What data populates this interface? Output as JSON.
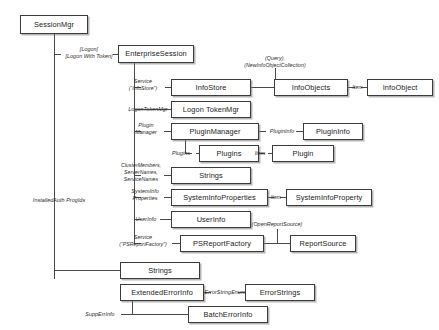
{
  "diagram": {
    "type": "object-model-diagram",
    "nodes": [
      {
        "id": "session-mgr",
        "label": "SessionMgr",
        "x": 20,
        "y": 15,
        "w": 68,
        "h": 19
      },
      {
        "id": "enterprise-session",
        "label": "EnterpriseSession",
        "x": 118,
        "y": 45,
        "w": 76,
        "h": 18
      },
      {
        "id": "info-store",
        "label": "InfoStore",
        "x": 171,
        "y": 79,
        "w": 80,
        "h": 17
      },
      {
        "id": "info-objects",
        "label": "InfoObjects",
        "x": 274,
        "y": 79,
        "w": 74,
        "h": 17
      },
      {
        "id": "info-object",
        "label": "InfoObject",
        "x": 367,
        "y": 79,
        "w": 66,
        "h": 17
      },
      {
        "id": "logon-token-mgr",
        "label": "Logon TokenMgr",
        "x": 171,
        "y": 101,
        "w": 80,
        "h": 17
      },
      {
        "id": "plugin-manager",
        "label": "PluginManager",
        "x": 171,
        "y": 123,
        "w": 88,
        "h": 17
      },
      {
        "id": "plugin-info",
        "label": "PluginInfo",
        "x": 303,
        "y": 123,
        "w": 60,
        "h": 17
      },
      {
        "id": "plugins",
        "label": "Plugins",
        "x": 199,
        "y": 145,
        "w": 60,
        "h": 17
      },
      {
        "id": "plugin",
        "label": "Plugin",
        "x": 272,
        "y": 145,
        "w": 62,
        "h": 17
      },
      {
        "id": "strings-cluster",
        "label": "Strings",
        "x": 171,
        "y": 167,
        "w": 80,
        "h": 17
      },
      {
        "id": "system-info-properties",
        "label": "SystemInfoProperties",
        "x": 171,
        "y": 189,
        "w": 97,
        "h": 17
      },
      {
        "id": "system-info-property",
        "label": "SystemInfoProperty",
        "x": 286,
        "y": 189,
        "w": 86,
        "h": 17
      },
      {
        "id": "user-info",
        "label": "UserInfo",
        "x": 171,
        "y": 211,
        "w": 80,
        "h": 17
      },
      {
        "id": "ps-report-factory",
        "label": "PSReportFactory",
        "x": 180,
        "y": 235,
        "w": 84,
        "h": 17
      },
      {
        "id": "report-source",
        "label": "ReportSource",
        "x": 290,
        "y": 235,
        "w": 66,
        "h": 17
      },
      {
        "id": "strings-auth",
        "label": "Strings",
        "x": 120,
        "y": 262,
        "w": 80,
        "h": 17
      },
      {
        "id": "extended-error-info",
        "label": "ExtendedErrorInfo",
        "x": 120,
        "y": 284,
        "w": 84,
        "h": 17
      },
      {
        "id": "error-strings",
        "label": "ErrorStrings",
        "x": 245,
        "y": 284,
        "w": 70,
        "h": 17
      },
      {
        "id": "batch-error-info",
        "label": "BatchErrorInfo",
        "x": 188,
        "y": 306,
        "w": 80,
        "h": 17
      }
    ],
    "edge_labels": [
      {
        "id": "lbl-logon",
        "line1": "[Logon]",
        "line2": "[Logon With Token]",
        "x": 61,
        "y": 46,
        "w": 56
      },
      {
        "id": "lbl-service-infostore",
        "line1": "Service",
        "line2": "(“InfoStore”)",
        "x": 119,
        "y": 78,
        "w": 50
      },
      {
        "id": "lbl-query",
        "line1": "(Query),",
        "line2": "(NewInfoObjectCollection)",
        "x": 244,
        "y": 56,
        "w": 62
      },
      {
        "id": "lbl-item-infoobject",
        "line1": "Item",
        "line2": "",
        "x": 348,
        "y": 83,
        "w": 19
      },
      {
        "id": "lbl-logontokenmgr",
        "line1": "LogonTokenMgr",
        "line2": "",
        "x": 125,
        "y": 106,
        "w": 46
      },
      {
        "id": "lbl-plugin-manager",
        "line1": "Plugin",
        "line2": "Manager",
        "x": 125,
        "y": 122,
        "w": 44
      },
      {
        "id": "lbl-plugininfo",
        "line1": "PluginInfo",
        "line2": "",
        "x": 263,
        "y": 128,
        "w": 38
      },
      {
        "id": "lbl-plugins",
        "line1": "Plugins",
        "line2": "",
        "x": 167,
        "y": 150,
        "w": 30
      },
      {
        "id": "lbl-item-plugin",
        "line1": "Item",
        "line2": "",
        "x": 250,
        "y": 150,
        "w": 20
      },
      {
        "id": "lbl-clustermembers",
        "line1": "ClusterMembers,",
        "line2": "ServerNames,",
        "line3": "ServiceNames",
        "x": 116,
        "y": 163,
        "w": 54
      },
      {
        "id": "lbl-systeminfoprops",
        "line1": "SystemInfo",
        "line2": "Properties",
        "x": 122,
        "y": 188,
        "w": 48
      },
      {
        "id": "lbl-item-sysinfoprop",
        "line1": "Item",
        "line2": "",
        "x": 266,
        "y": 193,
        "w": 20
      },
      {
        "id": "lbl-userinfo",
        "line1": "UserInfo",
        "line2": "",
        "x": 127,
        "y": 215,
        "w": 38
      },
      {
        "id": "lbl-service-psreport",
        "line1": "Service",
        "line2": "(“PSReportFactory”)",
        "x": 110,
        "y": 234,
        "w": 68
      },
      {
        "id": "lbl-openreportsource",
        "line1": "(OpenReportSource)",
        "line2": "",
        "x": 244,
        "y": 222,
        "w": 64
      },
      {
        "id": "lbl-installedauth",
        "line1": "InstalledAuth ProgIds",
        "line2": "",
        "x": 22,
        "y": 197,
        "w": 74
      },
      {
        "id": "lbl-errorstringenum",
        "line1": "ErrorStringEnum",
        "line2": "",
        "x": 204,
        "y": 289,
        "w": 42
      },
      {
        "id": "lbl-supperrinfo",
        "line1": "SuppErrInfo",
        "line2": "",
        "x": 79,
        "y": 311,
        "w": 42
      }
    ]
  }
}
